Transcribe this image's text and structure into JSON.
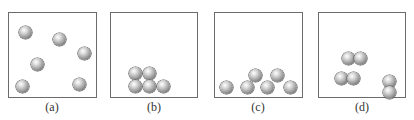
{
  "panels": [
    {
      "id": "a",
      "label": "(a)",
      "description": "gas - particles widely spaced and randomly distributed",
      "box": {
        "left": 8,
        "width": 89
      },
      "particles": [
        [
          18,
          25
        ],
        [
          52,
          32
        ],
        [
          77,
          46
        ],
        [
          30,
          57
        ],
        [
          15,
          79
        ],
        [
          72,
          77
        ]
      ]
    },
    {
      "id": "b",
      "label": "(b)",
      "description": "solid - particles closely packed in ordered cluster",
      "box": {
        "left": 110,
        "width": 88
      },
      "particles": [
        [
          24,
          61
        ],
        [
          38,
          61
        ],
        [
          24,
          74
        ],
        [
          38,
          74
        ],
        [
          52,
          74
        ]
      ]
    },
    {
      "id": "c",
      "label": "(c)",
      "description": "liquid - particles close together but not ordered",
      "box": {
        "left": 214,
        "width": 89
      },
      "particles": [
        [
          5,
          74
        ],
        [
          29,
          74
        ],
        [
          37,
          62
        ],
        [
          48,
          74
        ],
        [
          57,
          62
        ],
        [
          70,
          74
        ]
      ]
    },
    {
      "id": "d",
      "label": "(d)",
      "description": "gas of diatomic molecules",
      "box": {
        "left": 318,
        "width": 88
      },
      "particles": [
        [
          22,
          40
        ],
        [
          34,
          40
        ],
        [
          15,
          62
        ],
        [
          27,
          62
        ],
        [
          63,
          66
        ],
        [
          63,
          77
        ]
      ]
    }
  ]
}
